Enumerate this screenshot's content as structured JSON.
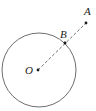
{
  "diagram": {
    "type": "geometry",
    "colors": {
      "stroke": "#6e6e6e",
      "point": "#1a1a1a",
      "label": "#222222",
      "background": "#ffffff"
    },
    "circle": {
      "cx": 39,
      "cy": 70,
      "r": 37
    },
    "points": [
      {
        "id": "O",
        "label": "O",
        "x": 38,
        "y": 70,
        "label_x": 25,
        "label_y": 74
      },
      {
        "id": "B",
        "label": "B",
        "x": 65,
        "y": 43,
        "label_x": 60,
        "label_y": 38
      },
      {
        "id": "A",
        "label": "A",
        "x": 86,
        "y": 23,
        "label_x": 84,
        "label_y": 15
      }
    ],
    "segments": [
      {
        "from": "O",
        "to": "A",
        "style": "dashed"
      }
    ]
  }
}
